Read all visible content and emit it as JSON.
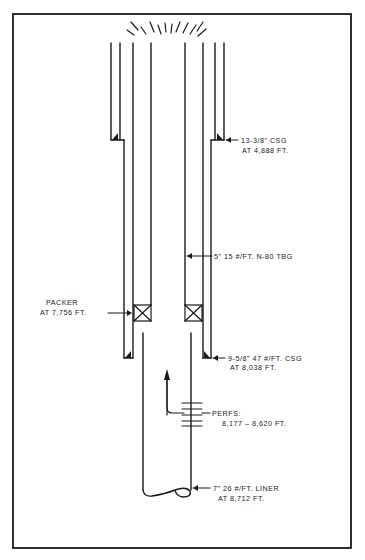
{
  "diagram": {
    "type": "wellbore-schematic",
    "colors": {
      "ink": "#1a1a1a",
      "background": "#ffffff"
    },
    "labels": {
      "surface_casing": {
        "line1": "13-3/8\" CSG",
        "line2": "AT 4,888 FT."
      },
      "tubing": {
        "line1": "5\" 15 #/FT. N-80 TBG"
      },
      "packer": {
        "line1": "PACKER",
        "line2": "AT 7,756 FT."
      },
      "intermediate_casing": {
        "line1": "9-5/8\" 47 #/FT. CSG",
        "line2": "AT 8,038 FT."
      },
      "perforations": {
        "line1": "PERFS:",
        "line2": "8,177 – 8,620 FT."
      },
      "liner": {
        "line1": "7\" 26 #/FT. LINER",
        "line2": "AT 8,712 FT."
      }
    },
    "components": [
      {
        "name": "13-3/8 in casing",
        "shoe_depth_ft": 4888
      },
      {
        "name": "9-5/8 in 47 lb/ft casing",
        "shoe_depth_ft": 8038
      },
      {
        "name": "5 in 15 lb/ft N-80 tubing"
      },
      {
        "name": "packer",
        "depth_ft": 7756
      },
      {
        "name": "perforations",
        "top_ft": 8177,
        "bottom_ft": 8620
      },
      {
        "name": "7 in 26 lb/ft liner",
        "depth_ft": 8712
      }
    ]
  }
}
